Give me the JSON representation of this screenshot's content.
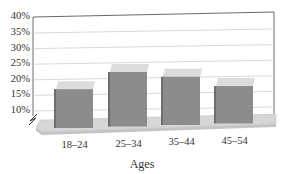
{
  "chart_data": {
    "type": "bar",
    "style": "3d-column",
    "title": "",
    "xlabel": "Ages",
    "ylabel": "",
    "categories": [
      "18–24",
      "25–34",
      "35–44",
      "45–54"
    ],
    "values": [
      17,
      22.5,
      21,
      18
    ],
    "yticks": [
      "10%",
      "15%",
      "20%",
      "25%",
      "30%",
      "35%",
      "40%"
    ],
    "ylim": [
      10,
      40
    ],
    "axis_break": true,
    "grid": true,
    "legend": null,
    "colors": {
      "bar_front": "#8c8c8c",
      "bar_top": "#dcdcdc",
      "bar_side": "#6e6e6e",
      "floor": "#d4d4d4",
      "grid": "#c8c8c8",
      "frame": "#444444"
    }
  }
}
